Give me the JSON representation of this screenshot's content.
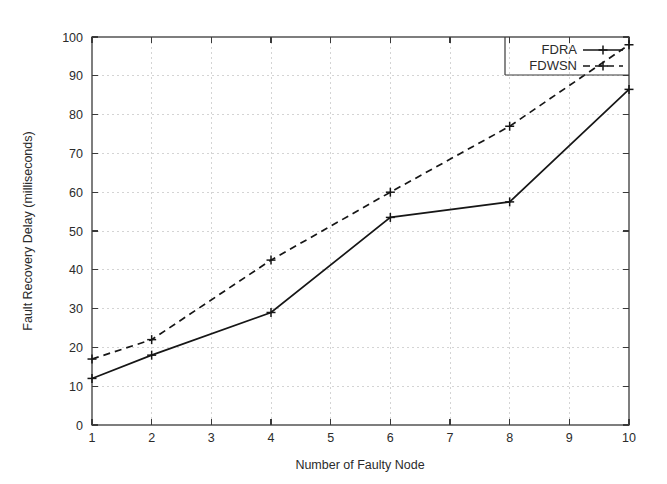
{
  "chart_data": {
    "type": "line",
    "title": "",
    "xlabel": "Number of Faulty Node",
    "ylabel": "Fault Recovery Delay (milliseconds)",
    "xlim": [
      1,
      10
    ],
    "ylim": [
      0,
      100
    ],
    "xticks": [
      1,
      2,
      3,
      4,
      5,
      6,
      7,
      8,
      9,
      10
    ],
    "yticks": [
      0,
      10,
      20,
      30,
      40,
      50,
      60,
      70,
      80,
      90,
      100
    ],
    "grid": true,
    "legend_position": "top-right",
    "series": [
      {
        "name": "FDRA",
        "style": "solid",
        "marker": "plus",
        "x": [
          1,
          2,
          4,
          6,
          8,
          10
        ],
        "values": [
          12,
          18,
          29,
          53.5,
          57.5,
          86.5
        ]
      },
      {
        "name": "FDWSN",
        "style": "dashed",
        "marker": "plus",
        "x": [
          1,
          2,
          4,
          6,
          8,
          10
        ],
        "values": [
          17,
          22,
          42.5,
          60,
          77,
          98
        ]
      }
    ]
  },
  "axes": {
    "x_tick_labels": [
      "1",
      "2",
      "3",
      "4",
      "5",
      "6",
      "7",
      "8",
      "9",
      "10"
    ],
    "y_tick_labels": [
      "0",
      "10",
      "20",
      "30",
      "40",
      "50",
      "60",
      "70",
      "80",
      "90",
      "100"
    ],
    "x_title": "Number of Faulty Node",
    "y_title": "Fault Recovery Delay (milliseconds)"
  },
  "legend": {
    "entries": [
      {
        "label": "FDRA"
      },
      {
        "label": "FDWSN"
      }
    ]
  }
}
